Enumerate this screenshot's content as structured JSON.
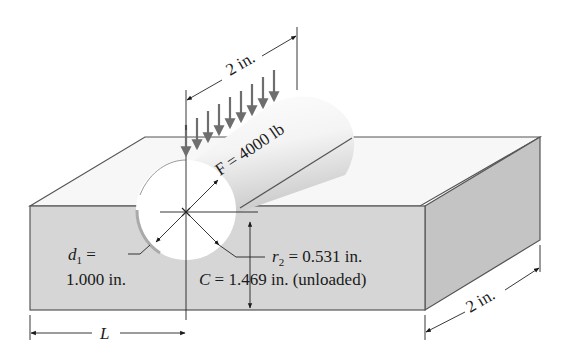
{
  "diagram": {
    "type": "engineering-stress-diagram",
    "load_span_label": "2 in.",
    "force_label": "F = 4000 lb",
    "d1_label_line1": "d1 =",
    "d1_symbol": "d",
    "d1_subscript": "1",
    "d1_eq": " =",
    "d1_value": "1.000 in.",
    "r2_symbol": "r",
    "r2_subscript": "2",
    "r2_value": " = 0.531 in.",
    "c_symbol": "C",
    "c_value": " = 1.469 in. (unloaded)",
    "length_label": "L",
    "depth_label": "2 in.",
    "load_arrow_count": 9,
    "colors": {
      "block_front": "#d6d6d6",
      "block_side": "#c2c2c2",
      "block_top": "#f7f7f7",
      "edge": "#555555",
      "arrow": "#6e6e6e",
      "cylinder": "#f2f2f2",
      "text": "#1a1a1a"
    }
  }
}
